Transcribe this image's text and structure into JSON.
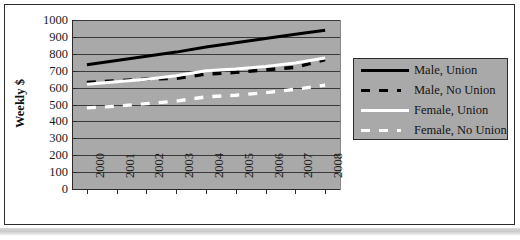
{
  "figure": {
    "y_axis_title": "Weekly $"
  },
  "chart_data": {
    "type": "line",
    "title": "",
    "xlabel": "",
    "ylabel": "Weekly $",
    "ylim": [
      0,
      1000
    ],
    "ytick_step": 100,
    "yticks": [
      "1000",
      "900",
      "800",
      "700",
      "600",
      "500",
      "400",
      "300",
      "200",
      "100",
      "0"
    ],
    "grid": true,
    "legend_position": "right",
    "plot_background": "#a9a9a9",
    "categories": [
      "2000",
      "2001",
      "2002",
      "2003",
      "2004",
      "2005",
      "2006",
      "2007",
      "2008"
    ],
    "series": [
      {
        "name": "Male, Union",
        "color": "#000000",
        "style": "solid",
        "values": [
          735,
          760,
          785,
          810,
          840,
          865,
          890,
          915,
          940
        ]
      },
      {
        "name": "Male, No Union",
        "color": "#000000",
        "style": "dashed",
        "values": [
          630,
          640,
          650,
          655,
          680,
          690,
          705,
          720,
          765
        ]
      },
      {
        "name": "Female, Union",
        "color": "#ffffff",
        "style": "solid",
        "values": [
          620,
          635,
          650,
          670,
          700,
          710,
          725,
          745,
          775
        ]
      },
      {
        "name": "Female, No Union",
        "color": "#ffffff",
        "style": "dashed",
        "values": [
          480,
          490,
          505,
          520,
          545,
          555,
          570,
          590,
          615
        ]
      }
    ]
  },
  "legend": {
    "items": [
      {
        "label": "Male, Union"
      },
      {
        "label": "Male, No Union"
      },
      {
        "label": "Female, Union"
      },
      {
        "label": "Female, No Union"
      }
    ]
  }
}
